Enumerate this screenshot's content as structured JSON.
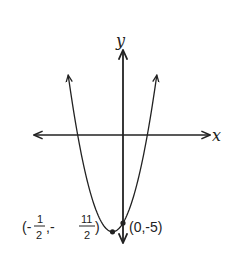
{
  "chart_data": {
    "type": "line",
    "title": "",
    "function": "y = 2x^2 + 2x - 5",
    "xlabel": "x",
    "ylabel": "y",
    "grid": false,
    "points": [
      {
        "x": -0.5,
        "y": -5.5,
        "label_parts": {
          "open": "(-",
          "x_num": "1",
          "x_den": "2",
          "sep": ",-",
          "y_num": "11",
          "y_den": "2",
          "close": ")"
        },
        "role": "vertex"
      },
      {
        "x": 0,
        "y": -5,
        "label": "(0,-5)",
        "role": "y-intercept"
      }
    ],
    "series": [
      {
        "name": "parabola",
        "x": [
          -2.61,
          -2,
          -1.5,
          -1,
          -0.5,
          0,
          0.5,
          1,
          1.61
        ],
        "y": [
          3.41,
          -1,
          -3.5,
          -5,
          -5.5,
          -5,
          -3.5,
          -1,
          3.41
        ]
      }
    ]
  },
  "colors": {
    "stroke": "#222222",
    "background": "#ffffff"
  }
}
